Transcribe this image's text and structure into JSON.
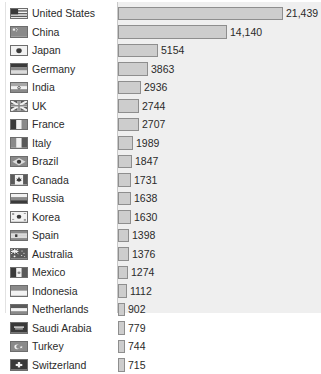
{
  "chart_data": {
    "type": "bar",
    "orientation": "horizontal",
    "title": "",
    "subtitle": "",
    "xlabel": "",
    "ylabel": "",
    "grid": false,
    "legend": "none",
    "axis_visible": false,
    "xlim": [
      0,
      21439
    ],
    "categories": [
      "United States",
      "China",
      "Japan",
      "Germany",
      "India",
      "UK",
      "France",
      "Italy",
      "Brazil",
      "Canada",
      "Russia",
      "Korea",
      "Spain",
      "Australia",
      "Mexico",
      "Indonesia",
      "Netherlands",
      "Saudi Arabia",
      "Turkey",
      "Switzerland"
    ],
    "values": [
      21439,
      14140,
      5154,
      3863,
      2936,
      2744,
      2707,
      1989,
      1847,
      1731,
      1638,
      1630,
      1398,
      1376,
      1274,
      1112,
      902,
      779,
      744,
      715
    ],
    "value_labels": [
      "21,439",
      "14,140",
      "5154",
      "3863",
      "2936",
      "2744",
      "2707",
      "1989",
      "1847",
      "1731",
      "1638",
      "1630",
      "1398",
      "1376",
      "1274",
      "1112",
      "902",
      "779",
      "744",
      "715"
    ],
    "colors": {
      "bar_fill": "#cdcdcd",
      "bar_stroke": "#8e8e8e",
      "panel_background": "#efefef",
      "page_background": "#ffffff",
      "text": "#2a2a2a"
    }
  },
  "rows": [
    {
      "country": "United States",
      "value_label": "21,439",
      "flag": "flag-united-states"
    },
    {
      "country": "China",
      "value_label": "14,140",
      "flag": "flag-china"
    },
    {
      "country": "Japan",
      "value_label": "5154",
      "flag": "flag-japan"
    },
    {
      "country": "Germany",
      "value_label": "3863",
      "flag": "flag-germany"
    },
    {
      "country": "India",
      "value_label": "2936",
      "flag": "flag-india"
    },
    {
      "country": "UK",
      "value_label": "2744",
      "flag": "flag-uk"
    },
    {
      "country": "France",
      "value_label": "2707",
      "flag": "flag-france"
    },
    {
      "country": "Italy",
      "value_label": "1989",
      "flag": "flag-italy"
    },
    {
      "country": "Brazil",
      "value_label": "1847",
      "flag": "flag-brazil"
    },
    {
      "country": "Canada",
      "value_label": "1731",
      "flag": "flag-canada"
    },
    {
      "country": "Russia",
      "value_label": "1638",
      "flag": "flag-russia"
    },
    {
      "country": "Korea",
      "value_label": "1630",
      "flag": "flag-korea"
    },
    {
      "country": "Spain",
      "value_label": "1398",
      "flag": "flag-spain"
    },
    {
      "country": "Australia",
      "value_label": "1376",
      "flag": "flag-australia"
    },
    {
      "country": "Mexico",
      "value_label": "1274",
      "flag": "flag-mexico"
    },
    {
      "country": "Indonesia",
      "value_label": "1112",
      "flag": "flag-indonesia"
    },
    {
      "country": "Netherlands",
      "value_label": "902",
      "flag": "flag-netherlands"
    },
    {
      "country": "Saudi Arabia",
      "value_label": "779",
      "flag": "flag-saudi-arabia"
    },
    {
      "country": "Turkey",
      "value_label": "744",
      "flag": "flag-turkey"
    },
    {
      "country": "Switzerland",
      "value_label": "715",
      "flag": "flag-switzerland"
    }
  ]
}
